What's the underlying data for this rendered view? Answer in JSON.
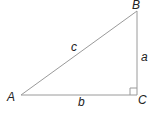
{
  "diagram": {
    "type": "right-triangle",
    "vertices": {
      "A": {
        "label": "A",
        "x": 21,
        "y": 95
      },
      "B": {
        "label": "B",
        "x": 137,
        "y": 11
      },
      "C": {
        "label": "C",
        "x": 137,
        "y": 95
      }
    },
    "sides": {
      "a": {
        "label": "a",
        "from": "B",
        "to": "C"
      },
      "b": {
        "label": "b",
        "from": "A",
        "to": "C"
      },
      "c": {
        "label": "c",
        "from": "A",
        "to": "B"
      }
    },
    "right_angle_at": "C",
    "colors": {
      "line": "#9a9a9a",
      "text": "#222222",
      "background": "#ffffff"
    }
  }
}
